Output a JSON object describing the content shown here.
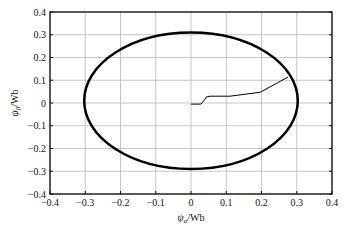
{
  "chart_data": {
    "type": "line",
    "title": "",
    "xlabel": "ψα/Wb",
    "ylabel": "ψβ/Wb",
    "xlim": [
      -0.4,
      0.4
    ],
    "ylim": [
      -0.4,
      0.4
    ],
    "grid": true,
    "legend": null,
    "x_ticks": [
      -0.4,
      -0.3,
      -0.2,
      -0.1,
      0,
      0.1,
      0.2,
      0.3,
      0.4
    ],
    "x_tick_labels": [
      "-0.4",
      "-0.3",
      "-0.2",
      "-0.1",
      "0",
      "0.1",
      "0.2",
      "0.3",
      "0.4"
    ],
    "y_ticks": [
      0.4,
      0.3,
      0.2,
      0.1,
      0,
      -0.1,
      -0.2,
      -0.3,
      -0.4
    ],
    "y_tick_labels": [
      "0.4",
      "0.3",
      "0.2",
      "0.1",
      "0",
      "-0.1",
      "-0.2",
      "-0.3",
      "-0.4"
    ],
    "series": [
      {
        "name": "flux circle (steady state)",
        "shape": "ellipse",
        "center": [
          0.0,
          0.01
        ],
        "rx": 0.303,
        "ry": 0.3,
        "stroke_width": 2.5,
        "color": "#000000"
      },
      {
        "name": "flux trajectory (start-up)",
        "x": [
          0.0,
          0.028,
          0.04,
          0.043,
          0.054,
          0.11,
          0.196,
          0.275
        ],
        "y": [
          -0.005,
          -0.005,
          0.017,
          0.026,
          0.03,
          0.03,
          0.047,
          0.114
        ],
        "stroke_width": 1,
        "color": "#000000"
      }
    ]
  },
  "axes": {
    "x_label_main": "ψ",
    "x_label_sub": "α",
    "x_label_unit": "/Wb",
    "y_label_main": "ψ",
    "y_label_sub": "β",
    "y_label_unit": "/Wb"
  },
  "colors": {
    "grid": "#b8b8b8",
    "frame": "#111111",
    "curve": "#000000"
  }
}
